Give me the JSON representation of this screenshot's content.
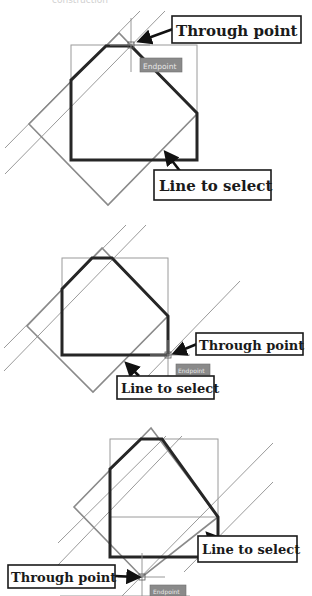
{
  "caption_fragment": "construction",
  "colors": {
    "heavy_line": "#262626",
    "thin_line": "#9a9a9a",
    "tag_bg": "#8a8a8a",
    "tag_text": "#e8e8e8",
    "callout_border": "#1a1a1a"
  },
  "panels": [
    {
      "id": "panel-1",
      "snap_tag": "Endpoint",
      "callouts": {
        "through_point": "Through point",
        "line_to_select": "Line to select"
      }
    },
    {
      "id": "panel-2",
      "snap_tag": "Endpoint",
      "callouts": {
        "through_point": "Through point",
        "line_to_select": "Line to select"
      }
    },
    {
      "id": "panel-3",
      "snap_tag": "Endpoint",
      "callouts": {
        "through_point": "Through point",
        "line_to_select": "Line to select"
      }
    }
  ]
}
